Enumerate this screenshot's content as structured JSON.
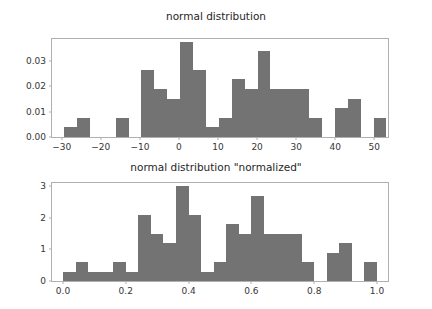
{
  "figure": {
    "background": "#ffffff",
    "bar_color": "#737373",
    "frame_color": "#b0b0b0",
    "tick_color": "#363636"
  },
  "chart_data": [
    {
      "type": "bar",
      "title": "normal distribution",
      "xlabel": "",
      "ylabel": "",
      "grid": false,
      "legend": null,
      "xlim": [
        -32.5,
        53.5
      ],
      "ylim": [
        0.0,
        0.0385
      ],
      "xticks": [
        -30,
        -20,
        -10,
        0,
        10,
        20,
        30,
        40,
        50
      ],
      "xticklabels": [
        "−30",
        "−20",
        "−10",
        "0",
        "10",
        "20",
        "30",
        "40",
        "50"
      ],
      "yticks": [
        0.0,
        0.01,
        0.02,
        0.03
      ],
      "yticklabels": [
        "0.00",
        "0.01",
        "0.02",
        "0.03"
      ],
      "bin_edges": [
        -29.4,
        -26.1,
        -22.8,
        -19.5,
        -16.2,
        -12.9,
        -9.6,
        -6.3,
        -3.0,
        0.3,
        3.6,
        6.9,
        10.2,
        13.5,
        16.8,
        20.1,
        23.4,
        26.7,
        30.0,
        33.3,
        36.6,
        39.9,
        43.2,
        46.5,
        49.8,
        53.1
      ],
      "values": [
        0.0038,
        0.0076,
        0.0,
        0.0,
        0.0076,
        0.0,
        0.0262,
        0.0189,
        0.0151,
        0.0372,
        0.0262,
        0.0038,
        0.0076,
        0.0227,
        0.0189,
        0.0336,
        0.0189,
        0.0189,
        0.0189,
        0.0076,
        0.0,
        0.0113,
        0.0151,
        0.0,
        0.0076,
        0.0076,
        0.0038
      ]
    },
    {
      "type": "bar",
      "title": "normal distribution \"normalized\"",
      "xlabel": "",
      "ylabel": "",
      "grid": false,
      "legend": null,
      "xlim": [
        -0.035,
        1.035
      ],
      "ylim": [
        0.0,
        3.1
      ],
      "xticks": [
        0.0,
        0.2,
        0.4,
        0.6,
        0.8,
        1.0
      ],
      "xticklabels": [
        "0.0",
        "0.2",
        "0.4",
        "0.6",
        "0.8",
        "1.0"
      ],
      "yticks": [
        0,
        1,
        2,
        3
      ],
      "yticklabels": [
        "0",
        "1",
        "2",
        "3"
      ],
      "bin_edges": [
        0.0,
        0.04,
        0.08,
        0.12,
        0.16,
        0.2,
        0.24,
        0.28,
        0.32,
        0.36,
        0.4,
        0.44,
        0.48,
        0.52,
        0.56,
        0.6,
        0.64,
        0.68,
        0.72,
        0.76,
        0.8,
        0.84,
        0.88,
        0.92,
        0.96,
        1.0
      ],
      "values": [
        0.3,
        0.6,
        0.3,
        0.3,
        0.6,
        0.3,
        2.1,
        1.5,
        1.2,
        3.0,
        2.1,
        0.3,
        0.6,
        1.8,
        1.5,
        2.7,
        1.5,
        1.5,
        1.5,
        0.6,
        0.0,
        0.9,
        1.2,
        0.0,
        0.6,
        0.6,
        0.3
      ]
    }
  ]
}
